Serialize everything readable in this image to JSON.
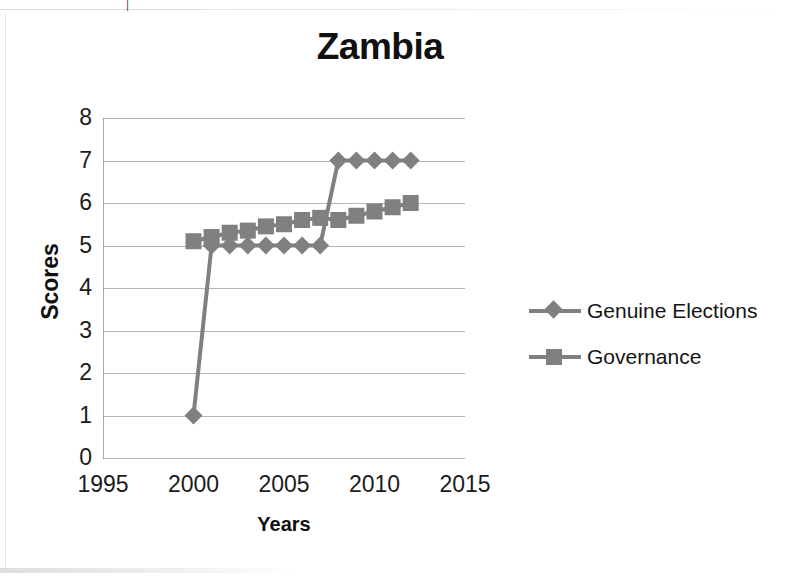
{
  "chart_data": {
    "type": "line",
    "title": "Zambia",
    "xlabel": "Years",
    "ylabel": "Scores",
    "xlim": [
      1995,
      2015
    ],
    "ylim": [
      0,
      8
    ],
    "xticks": [
      1995,
      2000,
      2005,
      2010,
      2015
    ],
    "yticks": [
      0,
      1,
      2,
      3,
      4,
      5,
      6,
      7,
      8
    ],
    "grid": true,
    "legend_position": "right",
    "series": [
      {
        "name": "Genuine Elections",
        "marker": "diamond",
        "color": "#808080",
        "x": [
          2000,
          2001,
          2002,
          2003,
          2004,
          2005,
          2006,
          2007,
          2008,
          2009,
          2010,
          2011,
          2012
        ],
        "values": [
          1,
          5,
          5,
          5,
          5,
          5,
          5,
          5,
          7,
          7,
          7,
          7,
          7
        ]
      },
      {
        "name": "Governance",
        "marker": "square",
        "color": "#808080",
        "x": [
          2000,
          2001,
          2002,
          2003,
          2004,
          2005,
          2006,
          2007,
          2008,
          2009,
          2010,
          2011,
          2012
        ],
        "values": [
          5.1,
          5.2,
          5.3,
          5.35,
          5.45,
          5.5,
          5.6,
          5.65,
          5.6,
          5.7,
          5.8,
          5.9,
          6.0
        ]
      }
    ]
  },
  "legend": {
    "entries": [
      {
        "label": "Genuine Elections",
        "marker": "diamond"
      },
      {
        "label": "Governance",
        "marker": "square"
      }
    ]
  },
  "scan_artifact": {
    "top_glyph": "|"
  }
}
